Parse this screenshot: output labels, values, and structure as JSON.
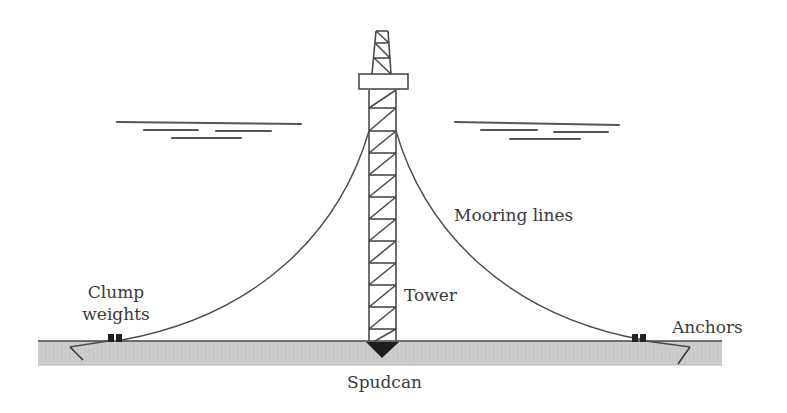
{
  "diagram": {
    "labels": {
      "mooring_lines": "Mooring lines",
      "tower": "Tower",
      "clump_weights_line1": "Clump",
      "clump_weights_line2": "weights",
      "anchors": "Anchors",
      "spudcan": "Spudcan"
    },
    "colors": {
      "line": "#4a4a4a",
      "seabed_fill": "#c9c9c9",
      "seabed_edge": "#555555",
      "solid": "#222222",
      "text": "#3a3a3a"
    }
  }
}
